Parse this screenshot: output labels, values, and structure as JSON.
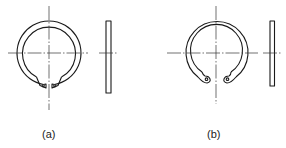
{
  "figure": {
    "panels": [
      {
        "id": "a",
        "label": "(a)",
        "description": "external retaining ring (circlip) with side view"
      },
      {
        "id": "b",
        "label": "(b)",
        "description": "internal retaining ring (circlip) with side view"
      }
    ],
    "colors": {
      "stroke": "#1a1a1a",
      "background": "#ffffff"
    }
  }
}
